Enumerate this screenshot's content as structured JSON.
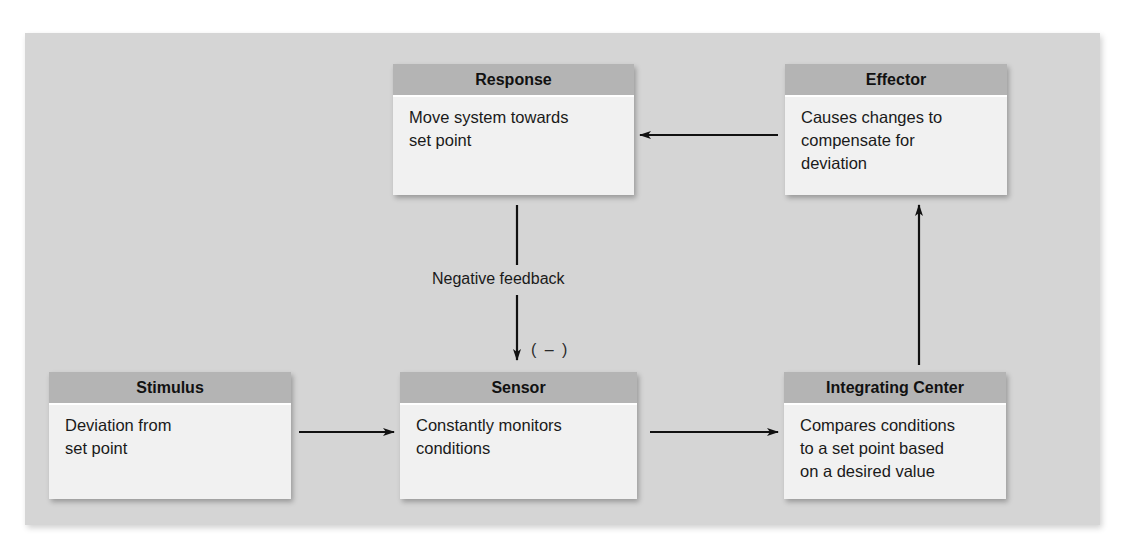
{
  "diagram": {
    "background_color": "#d5d5d5",
    "header_color": "#b4b4b4",
    "body_color": "#f1f1f1",
    "nodes": [
      {
        "id": "response",
        "title": "Response",
        "text": "Move system towards\nset point"
      },
      {
        "id": "effector",
        "title": "Effector",
        "text": "Causes changes to\ncompensate for\ndeviation"
      },
      {
        "id": "stimulus",
        "title": "Stimulus",
        "text": "Deviation from\nset point"
      },
      {
        "id": "sensor",
        "title": "Sensor",
        "text": "Constantly monitors\nconditions"
      },
      {
        "id": "integrating_center",
        "title": "Integrating Center",
        "text": "Compares conditions\nto a set point based\non a desired value"
      }
    ],
    "edges": [
      {
        "from": "stimulus",
        "to": "sensor"
      },
      {
        "from": "sensor",
        "to": "integrating_center"
      },
      {
        "from": "integrating_center",
        "to": "effector"
      },
      {
        "from": "effector",
        "to": "response"
      },
      {
        "from": "response",
        "to": "sensor",
        "label": "Negative feedback",
        "sign": "( – )"
      }
    ]
  }
}
